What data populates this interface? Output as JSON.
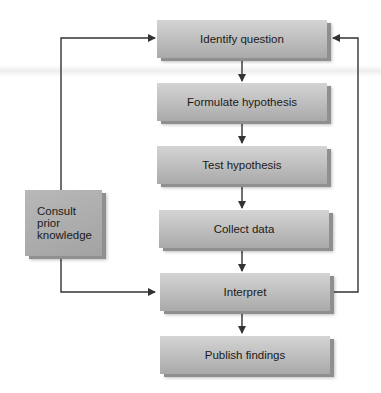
{
  "diagram": {
    "type": "flowchart",
    "main_steps": [
      {
        "id": "identify",
        "label": "Identify question"
      },
      {
        "id": "formulate",
        "label": "Formulate hypothesis"
      },
      {
        "id": "test",
        "label": "Test hypothesis"
      },
      {
        "id": "collect",
        "label": "Collect data"
      },
      {
        "id": "interpret",
        "label": "Interpret"
      },
      {
        "id": "publish",
        "label": "Publish findings"
      }
    ],
    "side_box": {
      "id": "consult",
      "lines": [
        "Consult",
        "prior",
        "knowledge"
      ]
    },
    "edges": [
      {
        "from": "identify",
        "to": "formulate"
      },
      {
        "from": "formulate",
        "to": "test"
      },
      {
        "from": "test",
        "to": "collect"
      },
      {
        "from": "collect",
        "to": "interpret"
      },
      {
        "from": "interpret",
        "to": "publish"
      },
      {
        "from": "interpret",
        "to": "identify",
        "route": "right-loop"
      },
      {
        "from": "consult",
        "to": "identify",
        "route": "left-up"
      },
      {
        "from": "consult",
        "to": "interpret",
        "route": "left-down"
      }
    ],
    "colors": {
      "box_fill": "#bdbdbd",
      "line": "#333333",
      "text": "#1a1a1a"
    }
  }
}
